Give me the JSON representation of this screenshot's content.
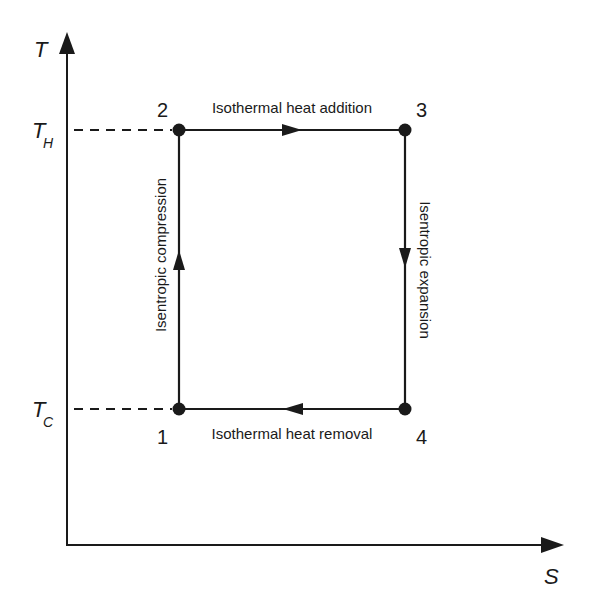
{
  "diagram": {
    "axes": {
      "y_label": "T",
      "x_label": "S",
      "levels": [
        {
          "symbol": "T",
          "subscript": "H"
        },
        {
          "symbol": "T",
          "subscript": "C"
        }
      ]
    },
    "states": [
      {
        "id": "1",
        "label": "1"
      },
      {
        "id": "2",
        "label": "2"
      },
      {
        "id": "3",
        "label": "3"
      },
      {
        "id": "4",
        "label": "4"
      }
    ],
    "processes": [
      {
        "from": "1",
        "to": "2",
        "label": "Isentropic compression"
      },
      {
        "from": "2",
        "to": "3",
        "label": "Isothermal heat addition"
      },
      {
        "from": "3",
        "to": "4",
        "label": "Isentropic expansion"
      },
      {
        "from": "4",
        "to": "1",
        "label": "Isothermal heat removal"
      }
    ]
  }
}
